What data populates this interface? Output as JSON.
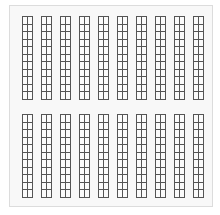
{
  "worksheet": {
    "background_color": "#f8f8f8",
    "line_color": "#555555",
    "blocks": [
      {
        "name": "top",
        "strips": 10,
        "rows": 11,
        "cols": 2
      },
      {
        "name": "bottom",
        "strips": 10,
        "rows": 11,
        "cols": 2
      }
    ]
  }
}
